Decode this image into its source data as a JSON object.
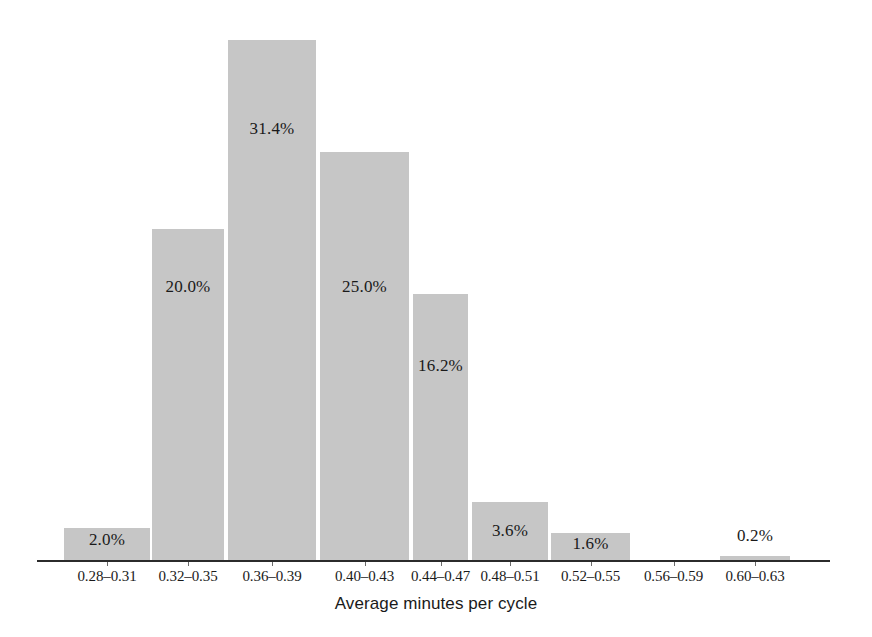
{
  "chart_data": {
    "type": "bar",
    "title": "",
    "subtitle": "",
    "xlabel": "Average minutes per cycle",
    "ylabel": "",
    "ylim": [
      0,
      35
    ],
    "grid": false,
    "legend": null,
    "value_suffix": "%",
    "categories": [
      "0.28–0.31",
      "0.32–0.35",
      "0.36–0.39",
      "0.40–0.43",
      "0.44–0.47",
      "0.48–0.51",
      "0.52–0.55",
      "0.56–0.59",
      "0.60–0.63"
    ],
    "values": [
      2.0,
      20.0,
      31.4,
      25.0,
      16.2,
      3.6,
      1.6,
      0.0,
      0.2
    ],
    "data_labels": [
      "2.0%",
      "20.0%",
      "31.4%",
      "25.0%",
      "16.2%",
      "3.6%",
      "1.6%",
      "",
      "0.2%"
    ],
    "bar_color": "#c6c6c6",
    "axis_color": "#2b2b2b",
    "text_color": "#1a1a1a"
  },
  "bars": [
    {
      "label": "2.0%",
      "tick": "0.28–0.31",
      "x": 64,
      "w": 86,
      "top": 528,
      "label_top": 530,
      "label_inside": true
    },
    {
      "label": "20.0%",
      "tick": "0.32–0.35",
      "x": 152,
      "w": 72,
      "top": 229,
      "label_top": 277,
      "label_inside": true
    },
    {
      "label": "31.4%",
      "tick": "0.36–0.39",
      "x": 228,
      "w": 88,
      "top": 40,
      "label_top": 119,
      "label_inside": true
    },
    {
      "label": "25.0%",
      "tick": "0.40–0.43",
      "x": 320,
      "w": 89,
      "top": 152,
      "label_top": 277,
      "label_inside": true
    },
    {
      "label": "16.2%",
      "tick": "0.44–0.47",
      "x": 413,
      "w": 55,
      "top": 294,
      "label_top": 356,
      "label_inside": true
    },
    {
      "label": "3.6%",
      "tick": "0.48–0.51",
      "x": 472,
      "w": 76,
      "top": 502,
      "label_top": 521,
      "label_inside": true
    },
    {
      "label": "1.6%",
      "tick": "0.52–0.55",
      "x": 551,
      "w": 79,
      "top": 533,
      "label_top": 534,
      "label_inside": true
    },
    {
      "label": "",
      "tick": "0.56–0.59",
      "x": 634,
      "w": 79,
      "top": 561,
      "label_top": 561,
      "label_inside": false
    },
    {
      "label": "0.2%",
      "tick": "0.60–0.63",
      "x": 720,
      "w": 70,
      "top": 556,
      "label_top": 526,
      "label_inside": false
    }
  ],
  "axis": {
    "baseline_y": 560,
    "x_start": 37,
    "x_end": 830,
    "xlabel": "Average minutes per cycle"
  }
}
